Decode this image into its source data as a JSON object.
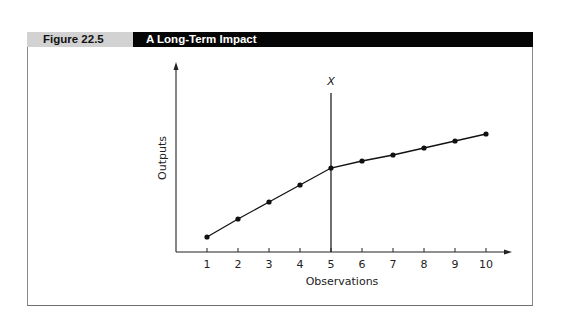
{
  "figure": {
    "number": "Figure 22.5",
    "title": "A Long-Term Impact"
  },
  "chart_data": {
    "type": "line",
    "title": "A Long-Term Impact",
    "xlabel": "Observations",
    "ylabel": "Outputs",
    "x": [
      1,
      2,
      3,
      4,
      5,
      6,
      7,
      8,
      9,
      10
    ],
    "categories": [
      "1",
      "2",
      "3",
      "4",
      "5",
      "6",
      "7",
      "8",
      "9",
      "10"
    ],
    "series": [
      {
        "name": "Outputs",
        "values": [
          15,
          33,
          50,
          67,
          84,
          91,
          97,
          104,
          111,
          118
        ]
      }
    ],
    "annotations": [
      {
        "type": "vertical-line",
        "x": 5,
        "label": "X"
      }
    ],
    "y_ticks": [],
    "grid": false,
    "legend": null,
    "ylim": [
      0,
      185
    ]
  }
}
